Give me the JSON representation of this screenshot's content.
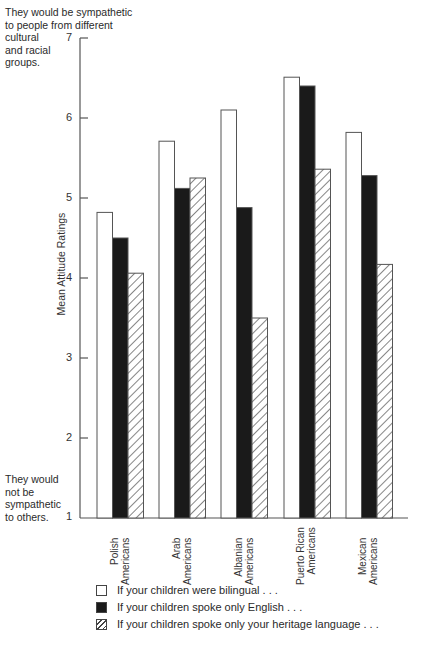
{
  "chart_data": {
    "type": "bar",
    "title": "",
    "xlabel": "",
    "ylabel": "Mean Attitude Ratings",
    "ylim": [
      1,
      7
    ],
    "yticks": [
      1,
      2,
      3,
      4,
      5,
      6,
      7
    ],
    "grid": false,
    "legend_position": "bottom",
    "categories": [
      "Polish Americans",
      "Arab Americans",
      "Albanian Americans",
      "Puerto Rican Americans",
      "Mexican Americans"
    ],
    "series": [
      {
        "name": "If your children were bilingual . . .",
        "fill": "white",
        "values": [
          4.82,
          5.71,
          6.1,
          6.51,
          5.82
        ]
      },
      {
        "name": "If your children spoke only English . . .",
        "fill": "black",
        "values": [
          4.5,
          5.12,
          4.88,
          6.4,
          5.28
        ]
      },
      {
        "name": "If your children spoke only your heritage language . . .",
        "fill": "hatched",
        "values": [
          4.06,
          5.25,
          3.5,
          5.36,
          4.17
        ]
      }
    ],
    "annotations": {
      "top": "They would be sympathetic\nto people from different\ncultural\nand racial\ngroups.",
      "bottom": "They would\nnot be\nsympathetic\nto others."
    }
  },
  "axis": {
    "ylabel": "Mean Attitude Ratings",
    "ticks": [
      "1",
      "2",
      "3",
      "4",
      "5",
      "6",
      "7"
    ]
  },
  "categories": [
    {
      "line1": "Polish",
      "line2": "Americans"
    },
    {
      "line1": "Arab",
      "line2": "Americans"
    },
    {
      "line1": "Albanian",
      "line2": "Americans"
    },
    {
      "line1": "Puerto Rican",
      "line2": "Americans"
    },
    {
      "line1": "Mexican",
      "line2": "Americans"
    }
  ],
  "annotations": {
    "top": "They would be sympathetic\nto people from different\ncultural\nand racial\ngroups.",
    "bottom": "They would\nnot be\nsympathetic\nto others."
  },
  "legend": [
    {
      "label": "If your children were bilingual . . ."
    },
    {
      "label": "If your children spoke only English . . ."
    },
    {
      "label": "If your children spoke only your heritage language . . ."
    }
  ],
  "colors": {
    "axis": "#555555",
    "bar_outline": "#555555",
    "black_bar": "#1a1a1a",
    "hatch": "#444444"
  }
}
